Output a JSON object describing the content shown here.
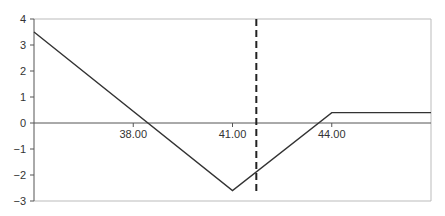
{
  "chart_data": {
    "type": "line",
    "title": "",
    "xlabel": "",
    "ylabel": "",
    "xlim": [
      35,
      47
    ],
    "ylim": [
      -3,
      4
    ],
    "grid": false,
    "legend": null,
    "x_ticks": [
      38,
      41,
      44
    ],
    "x_tick_labels": [
      "38.00",
      "41.00",
      "44.00"
    ],
    "y_ticks": [
      4,
      3,
      2,
      1,
      0,
      -1,
      -2,
      -3
    ],
    "y_tick_labels": [
      "4",
      "3",
      "2",
      "1",
      "0",
      "−1",
      "−2",
      "−3"
    ],
    "series": [
      {
        "name": "payoff",
        "x": [
          35,
          41,
          44,
          47
        ],
        "y": [
          3.5,
          -2.6,
          0.4,
          0.4
        ],
        "color": "#333333",
        "style": "solid"
      }
    ],
    "annotations": [
      {
        "type": "vertical-line",
        "x": 41.72,
        "style": "dashed",
        "color": "#222222"
      }
    ]
  }
}
